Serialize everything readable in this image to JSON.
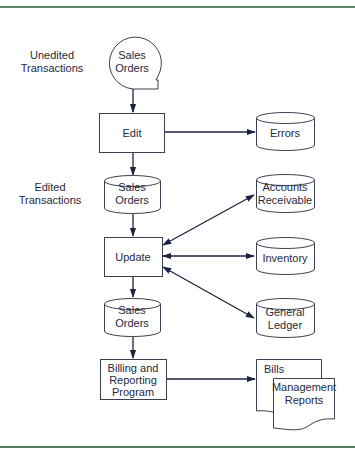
{
  "diagram": {
    "type": "system flowchart",
    "colors": {
      "frame_rule": "#5b8a6a",
      "line": "#1c2340",
      "text": "#262a3c",
      "shape_stroke": "#3a3f52"
    },
    "side_labels": {
      "unedited": [
        "Unedited",
        "Transactions"
      ],
      "edited": [
        "Edited",
        "Transactions"
      ]
    },
    "nodes": {
      "sales_orders_input": {
        "shape": "online-storage-circle",
        "lines": [
          "Sales",
          "Orders"
        ]
      },
      "edit": {
        "shape": "process",
        "lines": [
          "Edit"
        ]
      },
      "errors": {
        "shape": "disk",
        "lines": [
          "Errors"
        ]
      },
      "sales_orders_edited": {
        "shape": "disk",
        "lines": [
          "Sales",
          "Orders"
        ]
      },
      "accounts_receivable": {
        "shape": "disk",
        "lines": [
          "Accounts",
          "Receivable"
        ]
      },
      "update": {
        "shape": "process",
        "lines": [
          "Update"
        ]
      },
      "inventory": {
        "shape": "disk",
        "lines": [
          "Inventory"
        ]
      },
      "sales_orders_updated": {
        "shape": "disk",
        "lines": [
          "Sales",
          "Orders"
        ]
      },
      "general_ledger": {
        "shape": "disk",
        "lines": [
          "General",
          "Ledger"
        ]
      },
      "billing": {
        "shape": "process",
        "lines": [
          "Billing and",
          "Reporting",
          "Program"
        ]
      },
      "bills": {
        "shape": "document",
        "lines": [
          "Bills"
        ]
      },
      "management_reports": {
        "shape": "document",
        "lines": [
          "Management",
          "Reports"
        ]
      }
    },
    "edges": [
      {
        "from": "Sales Orders (unedited)",
        "to": "Edit",
        "direction": "forward"
      },
      {
        "from": "Edit",
        "to": "Errors",
        "direction": "forward"
      },
      {
        "from": "Edit",
        "to": "Sales Orders (edited)",
        "direction": "forward"
      },
      {
        "from": "Sales Orders (edited)",
        "to": "Update",
        "direction": "forward"
      },
      {
        "from": "Update",
        "to": "Accounts Receivable",
        "direction": "both"
      },
      {
        "from": "Update",
        "to": "Inventory",
        "direction": "both"
      },
      {
        "from": "Update",
        "to": "General Ledger",
        "direction": "both"
      },
      {
        "from": "Update",
        "to": "Sales Orders (updated)",
        "direction": "forward"
      },
      {
        "from": "Sales Orders (updated)",
        "to": "Billing and Reporting Program",
        "direction": "forward"
      },
      {
        "from": "Billing and Reporting Program",
        "to": "Bills / Management Reports",
        "direction": "forward"
      }
    ]
  }
}
